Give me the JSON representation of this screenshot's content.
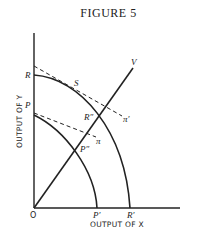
{
  "figure": {
    "title": "FIGURE 5",
    "x_axis_label": "OUTPUT OF X",
    "y_axis_label": "OUTPUT OF Y",
    "origin_label": "O",
    "labels": {
      "R": "R",
      "P": "P",
      "S": "S",
      "R2": "R″",
      "P2": "P″",
      "pi": "π",
      "pi_prime": "π′",
      "V": "V",
      "P_prime": "P′",
      "R_prime": "R′"
    },
    "colors": {
      "ink": "#222222"
    }
  }
}
